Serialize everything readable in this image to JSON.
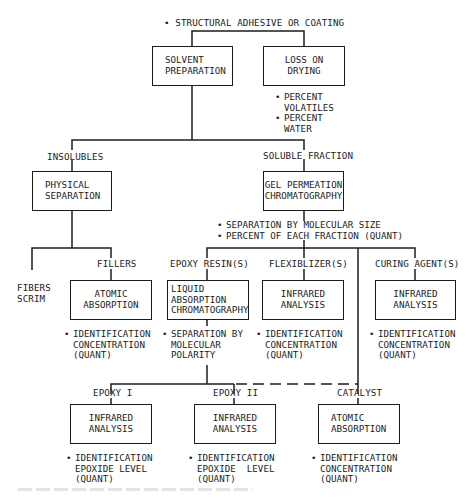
{
  "diagram": {
    "root_label": "STRUCTURAL ADHESIVE OR COATING",
    "level1": {
      "solvent_preparation": "SOLVENT\nPREPARATION",
      "loss_on_drying": "LOSS ON\nDRYING",
      "loss_on_drying_results": [
        "PERCENT\nVOLATILES",
        "PERCENT\nWATER"
      ]
    },
    "level2": {
      "insolubles_label": "INSOLUBLES",
      "soluble_fraction_label": "SOLUBLE FRACTION",
      "physical_separation": "PHYSICAL\nSEPARATION",
      "gel_permeation": "GEL PERMEATION\nCHROMATOGRAPHY",
      "gel_permeation_results": [
        "SEPARATION BY MOLECULAR SIZE",
        "PERCENT OF EACH FRACTION (QUANT)"
      ]
    },
    "level3": {
      "fibers_scrim_label": "FIBERS\nSCRIM",
      "fillers_label": "FILLERS",
      "fillers_method": "ATOMIC\nABSORPTION",
      "fillers_results": "IDENTIFICATION\nCONCENTRATION\n(QUANT)",
      "epoxy_resins_label": "EPOXY RESIN(S)",
      "epoxy_resins_method": "LIQUID\nABSORPTION\nCHROMATOGRAPHY",
      "epoxy_resins_results": "SEPARATION BY\nMOLECULAR\nPOLARITY",
      "flexiblizers_label": "FLEXIBLIZER(S)",
      "flexiblizers_method": "INFRARED\nANALYSIS",
      "flexiblizers_results": "IDENTIFICATION\nCONCENTRATION\n(QUANT)",
      "curing_agents_label": "CURING AGENT(S)",
      "curing_agents_method": "INFRARED\nANALYSIS",
      "curing_agents_results": "IDENTIFICATION\nCONCENTRATION\n(QUANT)"
    },
    "level4": {
      "epoxy1_label": "EPOXY I",
      "epoxy1_method": "INFRARED\nANALYSIS",
      "epoxy1_results": "IDENTIFICATION\nEPOXIDE LEVEL\n(QUANT)",
      "epoxy2_label": "EPOXY II",
      "epoxy2_method": "INFRARED\nANALYSIS",
      "epoxy2_results": "IDENTIFICATION\nEPOXIDE  LEVEL\n(QUANT)",
      "catalyst_label": "CATALYST",
      "catalyst_method": "ATOMIC\nABSORPTION",
      "catalyst_results": "IDENTIFICATION\nCONCENTRATION\n(QUANT)"
    },
    "bullet_glyph": "•",
    "line_color": "#1c1c1c"
  }
}
